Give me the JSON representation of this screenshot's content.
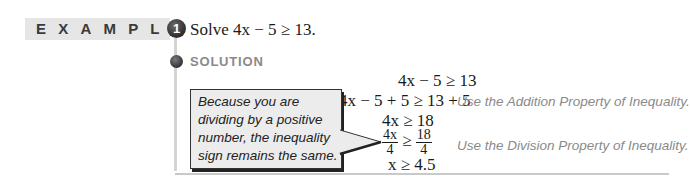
{
  "header": {
    "band_label": "EXAMPLE",
    "example_number": "1",
    "problem": "Solve 4x − 5 ≥ 13."
  },
  "solution": {
    "label": "SOLUTION",
    "steps": [
      {
        "math": "4x − 5 ≥ 13",
        "note": ""
      },
      {
        "math": "4x − 5 + 5 ≥ 13 + 5",
        "note": "Use the Addition Property of Inequality."
      },
      {
        "math": "4x ≥ 18",
        "note": ""
      },
      {
        "frac_left_num": "4x",
        "frac_left_den": "4",
        "op": "≥",
        "frac_right_num": "18",
        "frac_right_den": "4",
        "note": "Use the Division Property of Inequality."
      },
      {
        "math": "x ≥ 4.5",
        "note": ""
      }
    ]
  },
  "callout": {
    "text": "Because you are dividing by a positive number, the inequality sign remains the same."
  },
  "colors": {
    "band": "#e6e6e6",
    "badge": "#3a3a3a",
    "note_text": "#8a8a8a"
  }
}
